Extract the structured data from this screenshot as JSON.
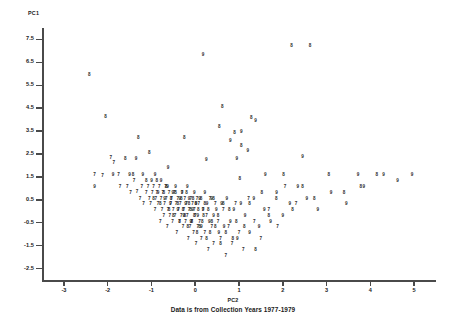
{
  "chart_data": {
    "type": "scatter",
    "title": "",
    "subtitle": "Data is from Collection Years 1977-1979",
    "xlabel": "PC2",
    "ylabel": "PC1",
    "xlim": [
      -3.5,
      5.5
    ],
    "ylim": [
      -3.0,
      8.0
    ],
    "grid": false,
    "legend": "none",
    "marker_style": "digit-glyph",
    "marker_note": "Each point is plotted as the last digit of its collection year: 7=1977, 8=1978, 9=1979",
    "xticks": [
      "-3",
      "-2",
      "-1",
      "0",
      "1",
      "2",
      "3",
      "4",
      "5"
    ],
    "xtick_values": [
      -3,
      -2,
      -1,
      0,
      1,
      2,
      3,
      4,
      5
    ],
    "yticks": [
      "7.5",
      "6.5",
      "5.5",
      "4.5",
      "3.5",
      "2.5",
      "1.5",
      "0.5",
      "-0.5",
      "-1.5",
      "-2.5"
    ],
    "ytick_values": [
      7.5,
      6.5,
      5.5,
      4.5,
      3.5,
      2.5,
      1.5,
      0.5,
      -0.5,
      -1.5,
      -2.5
    ],
    "series": [
      {
        "name": "1977",
        "label": "7",
        "points": [
          [
            -2.3,
            1.6
          ],
          [
            -2.12,
            1.52
          ],
          [
            -1.93,
            2.32
          ],
          [
            -1.86,
            2.12
          ],
          [
            -1.75,
            1.58
          ],
          [
            -1.72,
            1.08
          ],
          [
            -1.55,
            1.05
          ],
          [
            -1.48,
            0.78
          ],
          [
            -1.4,
            1.33
          ],
          [
            -1.33,
            0.82
          ],
          [
            -1.26,
            0.55
          ],
          [
            -1.22,
            1.05
          ],
          [
            -1.18,
            0.3
          ],
          [
            -1.12,
            0.8
          ],
          [
            -1.08,
            1.05
          ],
          [
            -1.05,
            0.55
          ],
          [
            -1.02,
            0.3
          ],
          [
            -0.98,
            0.8
          ],
          [
            -0.95,
            1.05
          ],
          [
            -0.92,
            0.05
          ],
          [
            -0.9,
            0.55
          ],
          [
            -0.88,
            0.8
          ],
          [
            -0.85,
            0.3
          ],
          [
            -0.82,
            1.05
          ],
          [
            -0.8,
            -0.45
          ],
          [
            -0.78,
            0.55
          ],
          [
            -0.76,
            0.05
          ],
          [
            -0.74,
            0.8
          ],
          [
            -0.72,
            -0.2
          ],
          [
            -0.7,
            0.3
          ],
          [
            -0.68,
            1.05
          ],
          [
            -0.66,
            0.55
          ],
          [
            -0.64,
            -0.7
          ],
          [
            -0.62,
            0.05
          ],
          [
            -0.6,
            0.8
          ],
          [
            -0.58,
            -0.2
          ],
          [
            -0.56,
            0.3
          ],
          [
            -0.54,
            0.55
          ],
          [
            -0.52,
            -0.45
          ],
          [
            -0.5,
            0.05
          ],
          [
            -0.48,
            0.8
          ],
          [
            -0.46,
            -0.2
          ],
          [
            -0.44,
            0.3
          ],
          [
            -0.42,
            -0.95
          ],
          [
            -0.4,
            0.55
          ],
          [
            -0.38,
            0.05
          ],
          [
            -0.36,
            -0.45
          ],
          [
            -0.34,
            0.3
          ],
          [
            -0.32,
            -0.2
          ],
          [
            -0.3,
            0.8
          ],
          [
            -0.28,
            -0.7
          ],
          [
            -0.26,
            0.05
          ],
          [
            -0.24,
            0.55
          ],
          [
            -0.22,
            -0.45
          ],
          [
            -0.2,
            0.3
          ],
          [
            -0.18,
            -0.2
          ],
          [
            -0.16,
            -1.2
          ],
          [
            -0.14,
            0.05
          ],
          [
            -0.12,
            -0.7
          ],
          [
            -0.1,
            0.55
          ],
          [
            -0.08,
            -0.45
          ],
          [
            -0.06,
            0.3
          ],
          [
            -0.04,
            -0.95
          ],
          [
            -0.02,
            0.05
          ],
          [
            0.0,
            -0.2
          ],
          [
            0.02,
            -1.45
          ],
          [
            0.04,
            0.55
          ],
          [
            0.06,
            -0.7
          ],
          [
            0.08,
            0.3
          ],
          [
            0.1,
            -0.45
          ],
          [
            0.14,
            -1.2
          ],
          [
            0.18,
            0.05
          ],
          [
            0.22,
            -0.95
          ],
          [
            0.26,
            -0.2
          ],
          [
            0.3,
            -1.7
          ],
          [
            0.34,
            0.55
          ],
          [
            0.38,
            -0.7
          ],
          [
            0.42,
            -1.45
          ],
          [
            0.46,
            0.3
          ],
          [
            0.52,
            -0.45
          ],
          [
            0.58,
            -1.2
          ],
          [
            0.64,
            0.05
          ],
          [
            0.7,
            -1.95
          ],
          [
            0.76,
            -0.7
          ],
          [
            0.84,
            -1.45
          ],
          [
            0.92,
            0.3
          ],
          [
            1.0,
            -0.95
          ],
          [
            1.1,
            -1.7
          ],
          [
            1.22,
            0.55
          ],
          [
            1.35,
            -0.45
          ],
          [
            1.5,
            -1.2
          ],
          [
            1.68,
            0.05
          ],
          [
            1.88,
            -0.7
          ],
          [
            2.05,
            1.05
          ],
          [
            2.3,
            0.3
          ]
        ]
      },
      {
        "name": "1978",
        "label": "8",
        "points": [
          [
            -2.42,
            5.95
          ],
          [
            -2.05,
            4.1
          ],
          [
            -1.6,
            2.3
          ],
          [
            -1.42,
            1.58
          ],
          [
            -1.3,
            3.2
          ],
          [
            -1.12,
            1.33
          ],
          [
            -0.95,
            0.55
          ],
          [
            -0.88,
            1.33
          ],
          [
            -0.8,
            0.3
          ],
          [
            -0.72,
            0.8
          ],
          [
            -0.66,
            1.05
          ],
          [
            -0.6,
            0.05
          ],
          [
            -0.55,
            0.55
          ],
          [
            -0.5,
            -0.2
          ],
          [
            -0.45,
            0.8
          ],
          [
            -0.4,
            0.3
          ],
          [
            -0.36,
            -0.45
          ],
          [
            -0.32,
            0.55
          ],
          [
            -0.28,
            0.05
          ],
          [
            -0.24,
            -0.2
          ],
          [
            -0.2,
            0.8
          ],
          [
            -0.17,
            -0.7
          ],
          [
            -0.14,
            0.3
          ],
          [
            -0.11,
            0.05
          ],
          [
            -0.08,
            -0.45
          ],
          [
            -0.05,
            0.55
          ],
          [
            -0.02,
            -0.2
          ],
          [
            0.01,
            0.3
          ],
          [
            0.04,
            -0.95
          ],
          [
            0.07,
            0.05
          ],
          [
            0.1,
            -0.7
          ],
          [
            0.13,
            0.55
          ],
          [
            0.16,
            -0.45
          ],
          [
            0.19,
            -0.2
          ],
          [
            0.22,
            0.3
          ],
          [
            0.26,
            -1.2
          ],
          [
            0.3,
            0.05
          ],
          [
            0.34,
            -0.95
          ],
          [
            0.38,
            -0.45
          ],
          [
            0.42,
            0.55
          ],
          [
            0.46,
            -0.7
          ],
          [
            0.52,
            -0.2
          ],
          [
            0.58,
            -1.45
          ],
          [
            0.64,
            0.3
          ],
          [
            0.7,
            -0.95
          ],
          [
            0.78,
            0.05
          ],
          [
            0.86,
            -1.2
          ],
          [
            0.94,
            -0.45
          ],
          [
            1.02,
            1.4
          ],
          [
            1.12,
            -0.7
          ],
          [
            1.24,
            0.3
          ],
          [
            1.38,
            -1.7
          ],
          [
            1.52,
            0.8
          ],
          [
            1.68,
            -0.2
          ],
          [
            1.85,
            0.55
          ],
          [
            2.02,
            1.58
          ],
          [
            2.22,
            0.05
          ],
          [
            2.45,
            1.05
          ],
          [
            2.72,
            0.55
          ],
          [
            3.05,
            1.58
          ],
          [
            3.4,
            0.8
          ],
          [
            3.78,
            1.05
          ],
          [
            4.15,
            1.58
          ],
          [
            2.2,
            7.2
          ],
          [
            2.62,
            7.2
          ],
          [
            0.9,
            3.4
          ],
          [
            1.28,
            4.05
          ],
          [
            0.62,
            4.55
          ],
          [
            0.55,
            3.7
          ],
          [
            1.05,
            2.85
          ],
          [
            -0.25,
            3.2
          ],
          [
            -1.05,
            2.55
          ]
        ]
      },
      {
        "name": "1979",
        "label": "9",
        "points": [
          [
            -1.88,
            1.58
          ],
          [
            -1.5,
            1.58
          ],
          [
            -1.35,
            2.3
          ],
          [
            -1.2,
            1.58
          ],
          [
            -1.0,
            1.3
          ],
          [
            -0.92,
            1.58
          ],
          [
            -0.85,
            0.8
          ],
          [
            -0.78,
            1.3
          ],
          [
            -0.7,
            0.55
          ],
          [
            -0.63,
            1.05
          ],
          [
            -0.57,
            0.3
          ],
          [
            -0.51,
            0.8
          ],
          [
            -0.45,
            1.05
          ],
          [
            -0.4,
            0.05
          ],
          [
            -0.35,
            0.55
          ],
          [
            -0.3,
            0.8
          ],
          [
            -0.26,
            -0.2
          ],
          [
            -0.22,
            0.3
          ],
          [
            -0.18,
            1.05
          ],
          [
            -0.14,
            0.55
          ],
          [
            -0.1,
            -0.45
          ],
          [
            -0.06,
            0.05
          ],
          [
            -0.02,
            0.8
          ],
          [
            0.02,
            0.3
          ],
          [
            0.06,
            -0.2
          ],
          [
            0.1,
            0.55
          ],
          [
            0.14,
            -0.7
          ],
          [
            0.18,
            0.05
          ],
          [
            0.22,
            0.8
          ],
          [
            0.27,
            0.3
          ],
          [
            0.32,
            -0.45
          ],
          [
            0.37,
            0.55
          ],
          [
            0.42,
            -0.2
          ],
          [
            0.48,
            0.05
          ],
          [
            0.54,
            -0.95
          ],
          [
            0.6,
            0.3
          ],
          [
            0.66,
            -0.7
          ],
          [
            0.72,
            0.55
          ],
          [
            0.8,
            -0.45
          ],
          [
            0.88,
            0.05
          ],
          [
            0.96,
            -1.2
          ],
          [
            1.04,
            0.3
          ],
          [
            1.14,
            -0.2
          ],
          [
            1.24,
            -0.95
          ],
          [
            1.34,
            0.55
          ],
          [
            1.46,
            -0.7
          ],
          [
            1.58,
            0.05
          ],
          [
            1.72,
            -0.45
          ],
          [
            1.86,
            0.8
          ],
          [
            2.0,
            -0.2
          ],
          [
            2.16,
            0.3
          ],
          [
            2.34,
            1.05
          ],
          [
            2.55,
            0.55
          ],
          [
            2.8,
            0.05
          ],
          [
            3.1,
            0.8
          ],
          [
            3.45,
            0.3
          ],
          [
            3.85,
            1.05
          ],
          [
            4.3,
            1.58
          ],
          [
            4.62,
            1.3
          ],
          [
            0.18,
            6.8
          ],
          [
            1.38,
            3.95
          ],
          [
            1.05,
            3.45
          ],
          [
            0.8,
            3.05
          ],
          [
            1.2,
            2.62
          ],
          [
            -0.62,
            1.88
          ],
          [
            0.25,
            2.25
          ],
          [
            0.95,
            2.3
          ],
          [
            1.6,
            1.58
          ],
          [
            2.45,
            2.35
          ],
          [
            3.72,
            1.58
          ],
          [
            -2.3,
            1.05
          ],
          [
            4.95,
            1.58
          ]
        ]
      }
    ]
  },
  "labels": {
    "pc1": "PC1",
    "pc2": "PC2",
    "subtitle": "Data is from Collection Years 1977-1979"
  }
}
